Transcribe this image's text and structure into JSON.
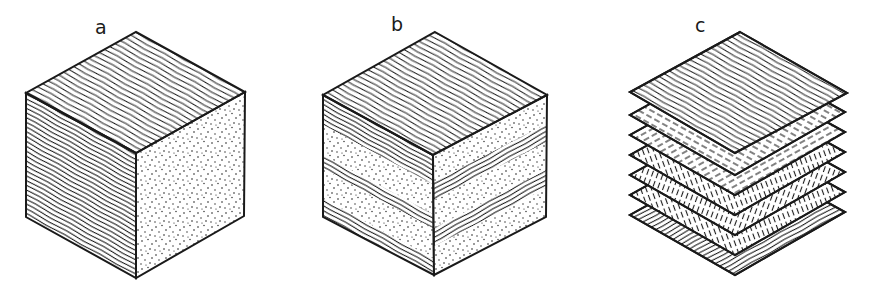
{
  "figure": {
    "panels": [
      {
        "id": "a",
        "label": "a",
        "description": "Solid wood block: grain lines on top and left faces, end grain stippled on right face"
      },
      {
        "id": "b",
        "label": "b",
        "description": "Laminated block: alternating layers of grain and stippled end-grain on side faces"
      },
      {
        "id": "c",
        "label": "c",
        "description": "Exploded stack of seven thin veneer sheets with alternating grain directions (plywood)"
      }
    ],
    "colors": {
      "ink": "#1a1a1a",
      "background": "#ffffff"
    }
  }
}
